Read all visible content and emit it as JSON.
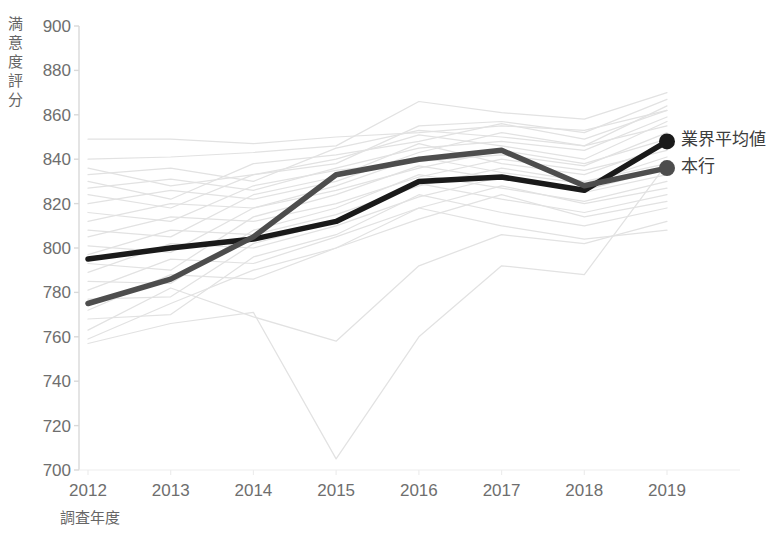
{
  "chart_data": {
    "type": "line",
    "title": "",
    "xlabel": "調査年度",
    "ylabel": "満意度評分",
    "categories": [
      "2012",
      "2013",
      "2014",
      "2015",
      "2016",
      "2017",
      "2018",
      "2019"
    ],
    "x": [
      2012,
      2013,
      2014,
      2015,
      2016,
      2017,
      2018,
      2019
    ],
    "ylim": [
      700,
      900
    ],
    "yticks": [
      700,
      720,
      740,
      760,
      780,
      800,
      820,
      840,
      860,
      880,
      900
    ],
    "ytick_labels": [
      "700",
      "720",
      "740",
      "760",
      "780",
      "800",
      "820",
      "840",
      "860",
      "880",
      "900"
    ],
    "grid": false,
    "legend_position": "right-inline-end-of-line",
    "series": [
      {
        "name": "業界平均値",
        "color": "#1a1a1a",
        "emphasis": true,
        "marker_at_last": true,
        "values": [
          795,
          800,
          804,
          812,
          830,
          832,
          826,
          848
        ]
      },
      {
        "name": "本行",
        "color": "#4d4d4d",
        "emphasis": true,
        "marker_at_last": true,
        "values": [
          775,
          786,
          805,
          833,
          840,
          844,
          828,
          836
        ]
      }
    ],
    "background_series": {
      "name": "他行各行 (背景)",
      "color": "#e2e2e2",
      "count": 24,
      "values": [
        [
          849,
          849,
          847,
          850,
          852,
          855,
          853,
          862
        ],
        [
          840,
          841,
          843,
          846,
          866,
          861,
          858,
          870
        ],
        [
          836,
          828,
          833,
          838,
          855,
          857,
          852,
          867
        ],
        [
          833,
          836,
          830,
          845,
          853,
          850,
          846,
          864
        ],
        [
          830,
          822,
          838,
          842,
          848,
          856,
          849,
          862
        ],
        [
          827,
          831,
          826,
          836,
          845,
          848,
          844,
          859
        ],
        [
          824,
          818,
          833,
          840,
          851,
          846,
          840,
          857
        ],
        [
          820,
          826,
          822,
          830,
          843,
          852,
          846,
          855
        ],
        [
          816,
          812,
          828,
          835,
          839,
          842,
          837,
          852
        ],
        [
          812,
          820,
          818,
          826,
          836,
          844,
          838,
          849
        ],
        [
          808,
          805,
          824,
          832,
          847,
          838,
          833,
          846
        ],
        [
          805,
          814,
          812,
          820,
          832,
          840,
          835,
          844
        ],
        [
          801,
          798,
          818,
          828,
          841,
          834,
          829,
          841
        ],
        [
          797,
          808,
          806,
          815,
          828,
          836,
          830,
          838
        ],
        [
          793,
          790,
          814,
          824,
          837,
          831,
          826,
          836
        ],
        [
          789,
          802,
          800,
          810,
          823,
          832,
          825,
          833
        ],
        [
          785,
          784,
          808,
          818,
          833,
          827,
          821,
          830
        ],
        [
          781,
          795,
          793,
          805,
          818,
          828,
          820,
          827
        ],
        [
          777,
          778,
          802,
          812,
          829,
          822,
          816,
          824
        ],
        [
          772,
          788,
          786,
          800,
          813,
          824,
          814,
          821
        ],
        [
          768,
          770,
          796,
          806,
          824,
          816,
          810,
          818
        ],
        [
          763,
          782,
          769,
          758,
          792,
          806,
          802,
          812
        ],
        [
          759,
          775,
          790,
          800,
          818,
          810,
          804,
          808
        ],
        [
          757,
          766,
          771,
          705,
          760,
          792,
          788,
          838
        ]
      ]
    }
  },
  "axis": {
    "y_title_chars": [
      "満",
      "意",
      "度",
      "評",
      "分"
    ]
  },
  "legend": {
    "items": [
      {
        "label": "業界平均値",
        "color": "#1a1a1a"
      },
      {
        "label": "本行",
        "color": "#4d4d4d"
      }
    ]
  }
}
